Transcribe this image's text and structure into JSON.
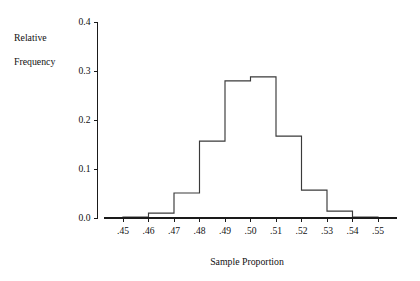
{
  "chart_data": {
    "type": "bar",
    "title": "",
    "subtitle": "",
    "xlabel": "Sample Proportion",
    "ylabel": "Relative Frequency",
    "ylabel_line1": "Relative",
    "ylabel_line2": "Frequency",
    "xlim": [
      0.4425,
      0.5575
    ],
    "ylim": [
      0.0,
      0.4
    ],
    "grid": false,
    "legend": false,
    "bin_width": 0.01,
    "bin_edges": [
      0.45,
      0.46,
      0.47,
      0.48,
      0.49,
      0.5,
      0.51,
      0.52,
      0.53,
      0.54,
      0.55
    ],
    "categories": [
      ".45-.46",
      ".46-.47",
      ".47-.48",
      ".48-.49",
      ".49-.50",
      ".50-.51",
      ".51-.52",
      ".52-.53",
      ".53-.54",
      ".54-.55"
    ],
    "values": [
      0.002,
      0.01,
      0.051,
      0.157,
      0.28,
      0.288,
      0.167,
      0.057,
      0.014,
      0.002
    ],
    "x_tick_labels": [
      ".45",
      ".46",
      ".47",
      ".48",
      ".49",
      ".50",
      ".51",
      ".52",
      ".53",
      ".54",
      ".55"
    ],
    "x_tick_values": [
      0.45,
      0.46,
      0.47,
      0.48,
      0.49,
      0.5,
      0.51,
      0.52,
      0.53,
      0.54,
      0.55
    ],
    "y_tick_labels": [
      "0.0",
      "0.1",
      "0.2",
      "0.3",
      "0.4"
    ],
    "y_tick_values": [
      0.0,
      0.1,
      0.2,
      0.3,
      0.4
    ],
    "colors": {
      "bar_stroke": "#3a3a3a",
      "bar_fill": "none",
      "axis": "#1a1a1a",
      "text": "#111111",
      "background": "#ffffff"
    }
  }
}
